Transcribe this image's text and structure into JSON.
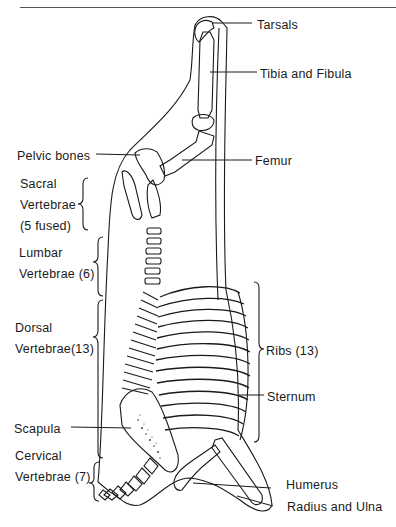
{
  "figure": {
    "labels": {
      "tarsals": "Tarsals",
      "tibia_fibula": "Tibia and Fibula",
      "pelvic": "Pelvic bones",
      "femur": "Femur",
      "sacral_1": "Sacral",
      "sacral_2": "Vertebrae",
      "sacral_3": "(5 fused)",
      "lumbar_1": "Lumbar",
      "lumbar_2": "Vertebrae (6)",
      "dorsal_1": "Dorsal",
      "dorsal_2": "Vertebrae(13)",
      "ribs": "Ribs (13)",
      "sternum": "Sternum",
      "scapula": "Scapula",
      "cervical_1": "Cervical",
      "cervical_2": "Vertebrae (7)",
      "humerus": "Humerus",
      "radius_ulna": "Radius and Ulna"
    }
  }
}
